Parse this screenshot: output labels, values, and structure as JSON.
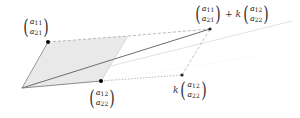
{
  "diagram": {
    "type": "vector-parallelogram",
    "colors": {
      "fill": "#e8e8e8",
      "edge": "#9a9a9a",
      "dark_line": "#707070",
      "faint_line": "#e2e2e2",
      "dashed": "#a0a0a0",
      "point": "#000000"
    },
    "points": {
      "origin": [
        22,
        88
      ],
      "a1": [
        48,
        42
      ],
      "a2": [
        101,
        81
      ],
      "corner": [
        128,
        36
      ],
      "a1_plus_k_a2": [
        210,
        29
      ],
      "k_a2": [
        182,
        75
      ],
      "faint_end": [
        292,
        21
      ]
    },
    "labels": {
      "a1": {
        "top": "a",
        "top_sub": "11",
        "bottom": "a",
        "bottom_sub": "21"
      },
      "a2": {
        "top": "a",
        "top_sub": "12",
        "bottom": "a",
        "bottom_sub": "22"
      },
      "sum": {
        "first": {
          "top": "a",
          "top_sub": "11",
          "bottom": "a",
          "bottom_sub": "21"
        },
        "operator": "+",
        "scalar": "k",
        "second": {
          "top": "a",
          "top_sub": "12",
          "bottom": "a",
          "bottom_sub": "22"
        }
      },
      "k_a2": {
        "scalar": "k",
        "vector": {
          "top": "a",
          "top_sub": "12",
          "bottom": "a",
          "bottom_sub": "22"
        }
      }
    }
  }
}
